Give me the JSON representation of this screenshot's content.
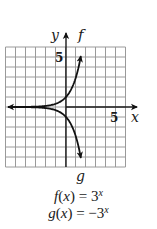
{
  "chart_data": {
    "type": "line",
    "title": "",
    "xlabel": "x",
    "ylabel": "y",
    "xlim": [
      -6,
      6
    ],
    "ylim": [
      -6,
      6
    ],
    "grid": true,
    "grid_step": 1,
    "tick_labels": {
      "x": [
        "5"
      ],
      "y": [
        "5"
      ]
    },
    "series": [
      {
        "name": "f",
        "equation": "f(x) = 3^x",
        "x": [
          -6,
          -5,
          -4,
          -3,
          -2,
          -1,
          0,
          0.5,
          1,
          1.5
        ],
        "y": [
          0.0014,
          0.0041,
          0.0123,
          0.037,
          0.111,
          0.333,
          1,
          1.732,
          3,
          5.196
        ]
      },
      {
        "name": "g",
        "equation": "g(x) = -3^x",
        "x": [
          -6,
          -5,
          -4,
          -3,
          -2,
          -1,
          0,
          0.5,
          1,
          1.5
        ],
        "y": [
          -0.0014,
          -0.0041,
          -0.0123,
          -0.037,
          -0.111,
          -0.333,
          -1,
          -1.732,
          -3,
          -5.196
        ]
      }
    ],
    "curve_labels": [
      "f",
      "g"
    ],
    "legend": [
      "f(x) = 3^x",
      "g(x) = -3^x"
    ]
  },
  "labels": {
    "y_axis": "y",
    "x_axis": "x",
    "x_tick_5": "5",
    "y_tick_5": "5",
    "curve_f": "f",
    "curve_g": "g"
  },
  "equations": {
    "f": {
      "lhs_fn": "f",
      "lhs_var": "x",
      "eq": " = ",
      "base": "3",
      "exp": "x"
    },
    "g": {
      "lhs_fn": "g",
      "lhs_var": "x",
      "eq": " = −3",
      "exp": "x"
    }
  },
  "colors": {
    "grid": "#9a9a9a",
    "axis": "#1a1a1a",
    "curve": "#111111",
    "background": "#ffffff"
  }
}
